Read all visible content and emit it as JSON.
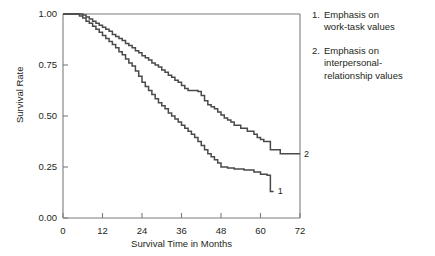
{
  "chart_data": {
    "type": "line",
    "title": "",
    "xlabel": "Survival Time in Months",
    "ylabel": "Survival Rate",
    "xlim": [
      0,
      72
    ],
    "ylim": [
      0,
      1
    ],
    "xticks": [
      "0",
      "12",
      "24",
      "36",
      "48",
      "60",
      "72"
    ],
    "xtick_values": [
      0,
      12,
      24,
      36,
      48,
      60,
      72
    ],
    "yticks": [
      "0.00",
      "0.25",
      "0.50",
      "0.75",
      "1.00"
    ],
    "ytick_values": [
      0,
      0.25,
      0.5,
      0.75,
      1
    ],
    "grid": false,
    "legend_position": "right",
    "step_style": "post",
    "line_color": "#4a4a4a",
    "axis_color": "#7d7d7d",
    "series": [
      {
        "name": "1",
        "label": "Emphasis on work-task values",
        "end_label": "1",
        "x": [
          0,
          3,
          5,
          6,
          7,
          8,
          9,
          10,
          11,
          12,
          13,
          14,
          15,
          16,
          17,
          18,
          19,
          20,
          21,
          22,
          23,
          24,
          25,
          26,
          27,
          28,
          29,
          30,
          31,
          32,
          33,
          34,
          35,
          36,
          37,
          38,
          39,
          40,
          41,
          42,
          43,
          44,
          45,
          46,
          47,
          48,
          50,
          52,
          55,
          58,
          60,
          62,
          63,
          64
        ],
        "y": [
          1.0,
          1.0,
          0.99,
          0.98,
          0.965,
          0.955,
          0.94,
          0.925,
          0.91,
          0.895,
          0.88,
          0.865,
          0.85,
          0.835,
          0.815,
          0.8,
          0.78,
          0.76,
          0.745,
          0.72,
          0.695,
          0.665,
          0.645,
          0.625,
          0.605,
          0.585,
          0.565,
          0.55,
          0.535,
          0.515,
          0.5,
          0.485,
          0.47,
          0.455,
          0.44,
          0.425,
          0.41,
          0.395,
          0.375,
          0.355,
          0.335,
          0.315,
          0.3,
          0.285,
          0.27,
          0.25,
          0.245,
          0.24,
          0.235,
          0.225,
          0.215,
          0.21,
          0.13,
          0.13
        ]
      },
      {
        "name": "2",
        "label": "Emphasis on interpersonal-relationship values",
        "end_label": "2",
        "x": [
          0,
          4,
          6,
          7,
          8,
          9,
          10,
          11,
          12,
          13,
          14,
          15,
          16,
          17,
          18,
          19,
          20,
          21,
          22,
          23,
          24,
          25,
          26,
          27,
          28,
          29,
          30,
          31,
          32,
          33,
          34,
          35,
          36,
          37,
          38,
          39,
          40,
          41,
          42,
          43,
          44,
          45,
          46,
          47,
          48,
          49,
          50,
          51,
          52,
          54,
          56,
          58,
          59,
          60,
          61,
          63,
          66,
          69,
          72
        ],
        "y": [
          1.0,
          1.0,
          0.995,
          0.985,
          0.975,
          0.965,
          0.955,
          0.945,
          0.935,
          0.925,
          0.915,
          0.9,
          0.89,
          0.88,
          0.87,
          0.855,
          0.845,
          0.835,
          0.82,
          0.81,
          0.795,
          0.785,
          0.775,
          0.76,
          0.75,
          0.74,
          0.725,
          0.715,
          0.7,
          0.69,
          0.675,
          0.665,
          0.65,
          0.635,
          0.625,
          0.625,
          0.625,
          0.62,
          0.6,
          0.575,
          0.555,
          0.545,
          0.535,
          0.52,
          0.505,
          0.49,
          0.48,
          0.47,
          0.455,
          0.44,
          0.425,
          0.41,
          0.395,
          0.385,
          0.375,
          0.335,
          0.315,
          0.315,
          0.315
        ]
      }
    ]
  },
  "legend": {
    "items": [
      {
        "number": "1.",
        "lines": [
          "Emphasis on",
          "work-task values"
        ]
      },
      {
        "number": "2.",
        "lines": [
          "Emphasis on",
          "interpersonal-",
          "relationship values"
        ]
      }
    ]
  }
}
